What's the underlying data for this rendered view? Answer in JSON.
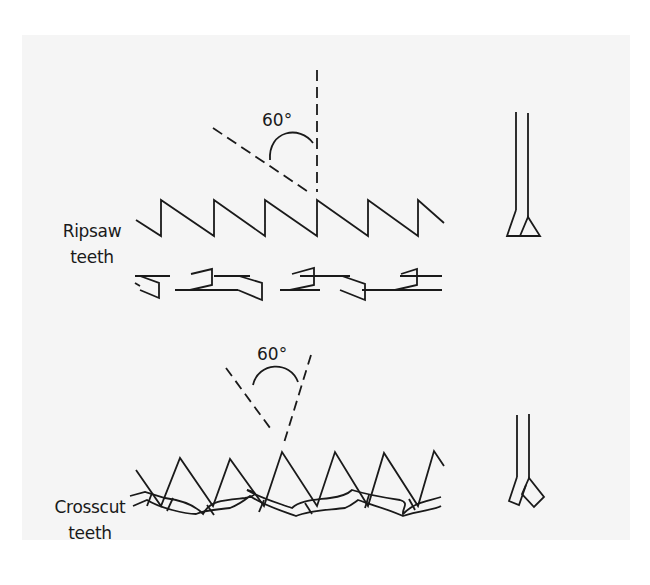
{
  "figure": {
    "ripsaw": {
      "label_line1": "Ripsaw",
      "label_line2": "teeth",
      "angle_label": "60°"
    },
    "crosscut": {
      "label_line1": "Crosscut",
      "label_line2": "teeth",
      "angle_label": "60°"
    }
  },
  "colors": {
    "background": "#f5f5f5",
    "stroke": "#1a1a1a"
  }
}
